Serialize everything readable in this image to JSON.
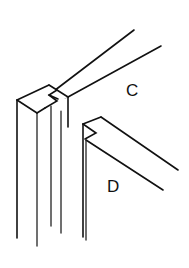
{
  "figure": {
    "type": "technical-line-drawing",
    "background_color": "#ffffff",
    "line_color": "#111111",
    "width": 189,
    "height": 268
  },
  "labels": {
    "top_rail": "C",
    "lower_rail": "D"
  },
  "label_positions": {
    "top_rail": {
      "x": 126,
      "y": 96
    },
    "lower_rail": {
      "x": 107,
      "y": 192
    }
  },
  "parts": [
    {
      "id": "vertical-stile",
      "name": "vertical stile",
      "description": "upright post shown in isometric with notch at top"
    },
    {
      "id": "top-rail",
      "name": "top rail C",
      "description": "horizontal board running up to the right, seated in the notch"
    },
    {
      "id": "lower-rail",
      "name": "lower rail D",
      "description": "second horizontal board below, with mitred end"
    }
  ],
  "geometry": {
    "stile": {
      "top_face": "17,100 49,85 68,97 37,113",
      "front_left_edge": "17,100 17,238",
      "inner_edge_a": "37,113 37,245",
      "inner_edge_b": "51,105 51,225",
      "inner_edge_c": "62,111 62,232",
      "top_back_edge": "49,85 68,97",
      "notch_upper": "49,85 57,90 50,94 58,99",
      "notch_lower": "37,113 45,108"
    },
    "top_rail": {
      "upper_edge": "50,94 134,30",
      "lower_edge": "68,97 161,46",
      "front_end_short": "58,99 68,97",
      "inner_vertical": "68,97 68,125"
    },
    "lower_rail": {
      "top_edge": "83,124 101,117",
      "upper_diagonal": "101,117 178,170",
      "lower_diagonal": "85,139 163,190",
      "notch": "83,124 95,133 85,139",
      "left_edge_outer": "83,124 83,237",
      "left_edge_inner": "86,139 86,240"
    }
  },
  "strokes": {
    "main_width": 1.6,
    "thin_width": 1.25
  }
}
